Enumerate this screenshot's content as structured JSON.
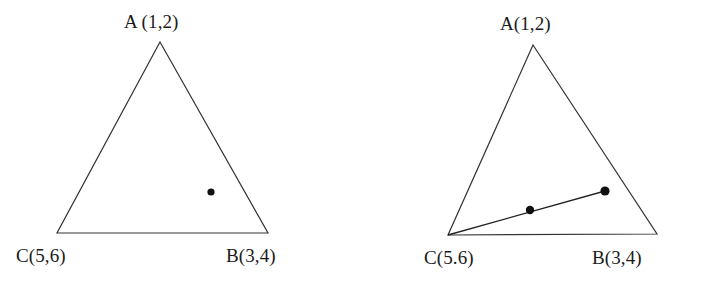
{
  "figure": {
    "background_color": "#ffffff",
    "stroke_color": "#333333",
    "marker_color": "#111111",
    "panels": [
      {
        "id": "left",
        "name": "triangle-left",
        "description": "Triangle with a single interior point",
        "vertices": [
          {
            "key": "A",
            "label": "A (1,2)",
            "x": 160,
            "y": 42,
            "label_x": 124,
            "label_y": 12
          },
          {
            "key": "C",
            "label": "C(5,6)",
            "x": 57,
            "y": 233,
            "label_x": 16,
            "label_y": 246
          },
          {
            "key": "B",
            "label": "B(3,4)",
            "x": 268,
            "y": 233,
            "label_x": 226,
            "label_y": 246
          }
        ],
        "points": [
          {
            "name": "interior-point-1",
            "x": 211,
            "y": 192,
            "radius": 3.6
          }
        ],
        "segments": []
      },
      {
        "id": "right",
        "name": "triangle-right",
        "description": "Triangle with a polyline from vertex C through two interior points",
        "vertices": [
          {
            "key": "A",
            "label": "A(1,2)",
            "x": 533,
            "y": 45,
            "label_x": 500,
            "label_y": 14
          },
          {
            "key": "C",
            "label": "C(5.6)",
            "x": 448,
            "y": 235,
            "label_x": 424,
            "label_y": 248
          },
          {
            "key": "B",
            "label": "B(3,4)",
            "x": 657,
            "y": 234,
            "label_x": 592,
            "label_y": 248
          }
        ],
        "points": [
          {
            "name": "interior-point-1",
            "x": 530,
            "y": 210,
            "radius": 4.2
          },
          {
            "name": "interior-point-2",
            "x": 605,
            "y": 191,
            "radius": 4.6
          }
        ],
        "segments": [
          {
            "name": "path-c-to-point2",
            "from": [
              448,
              235
            ],
            "to": [
              605,
              191
            ]
          }
        ]
      }
    ]
  }
}
